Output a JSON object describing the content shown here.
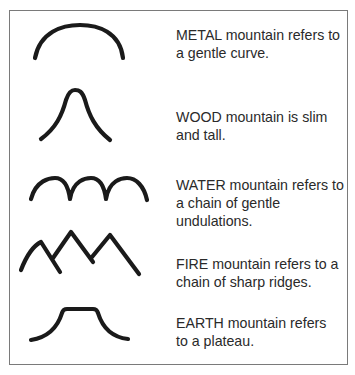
{
  "figure": {
    "border_color": "#7a7a7a",
    "stroke_color": "#1a1a1a"
  },
  "items": [
    {
      "element": "METAL",
      "icon": "metal-mountain-gentle-curve",
      "lines": [
        "METAL mountain refers to",
        "a gentle curve."
      ]
    },
    {
      "element": "WOOD",
      "icon": "wood-mountain-slim-tall",
      "lines": [
        "WOOD mountain is slim",
        "and tall."
      ]
    },
    {
      "element": "WATER",
      "icon": "water-mountain-undulations",
      "lines": [
        "WATER mountain refers to",
        "a chain of gentle",
        "undulations."
      ]
    },
    {
      "element": "FIRE",
      "icon": "fire-mountain-sharp-ridges",
      "lines": [
        "FIRE mountain refers to a",
        "chain of sharp ridges."
      ]
    },
    {
      "element": "EARTH",
      "icon": "earth-mountain-plateau",
      "lines": [
        "EARTH mountain refers",
        "to a plateau."
      ]
    }
  ]
}
